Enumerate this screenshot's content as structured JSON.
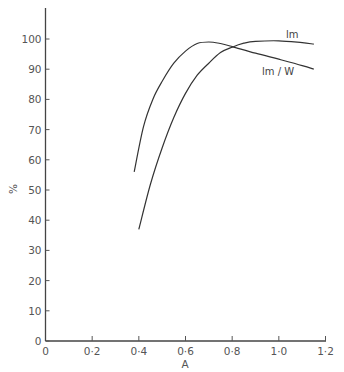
{
  "chart_data": {
    "type": "line",
    "title": "",
    "xlabel": "A",
    "ylabel": "%",
    "xlim": [
      0,
      1.2
    ],
    "ylim": [
      0,
      108
    ],
    "grid": false,
    "legend": "inline labels at curve ends",
    "x_ticks": [
      0,
      0.2,
      0.4,
      0.6,
      0.8,
      1.0,
      1.2
    ],
    "x_tick_labels": [
      "0",
      "0·2",
      "0·4",
      "0·6",
      "0·8",
      "1·0",
      "1·2"
    ],
    "y_ticks": [
      0,
      10,
      20,
      30,
      40,
      50,
      60,
      70,
      80,
      90,
      100
    ],
    "y_tick_labels": [
      "0",
      "10",
      "20",
      "30",
      "40",
      "50",
      "60",
      "70",
      "80",
      "90",
      "100"
    ],
    "series": [
      {
        "name": "lm/W",
        "label": "lm / W",
        "x": [
          0.38,
          0.42,
          0.46,
          0.5,
          0.55,
          0.6,
          0.65,
          0.7,
          0.75,
          0.8,
          0.9,
          1.0,
          1.1,
          1.15
        ],
        "values": [
          56,
          71,
          80,
          86,
          92,
          96,
          98.5,
          99,
          98.5,
          97.5,
          95.3,
          93.3,
          91.2,
          90
        ]
      },
      {
        "name": "lm",
        "label": "lm",
        "x": [
          0.4,
          0.45,
          0.5,
          0.55,
          0.6,
          0.65,
          0.7,
          0.75,
          0.8,
          0.85,
          0.9,
          1.0,
          1.1,
          1.15
        ],
        "values": [
          37,
          52,
          64,
          74,
          82,
          88,
          92,
          95.5,
          97.3,
          98.6,
          99.2,
          99.4,
          98.8,
          98.3
        ]
      }
    ]
  }
}
